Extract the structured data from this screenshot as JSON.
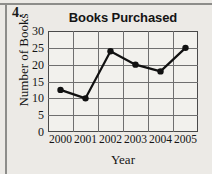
{
  "problem": {
    "number_label": "4."
  },
  "chart_data": {
    "type": "line",
    "title": "Books Purchased",
    "xlabel": "Year",
    "ylabel": "Number of Books",
    "categories": [
      "2000",
      "2001",
      "2002",
      "2003",
      "2004",
      "2005"
    ],
    "values": [
      12.5,
      10,
      24,
      20,
      18,
      25
    ],
    "ylim": [
      0,
      30
    ],
    "ytick_labels": [
      "0",
      "5",
      "10",
      "15",
      "20",
      "25",
      "30"
    ],
    "ytick_values": [
      0,
      5,
      10,
      15,
      20,
      25,
      30
    ],
    "grid": true,
    "legend": null,
    "marker": "filled-circle",
    "line_color": "#111111",
    "marker_color": "#111111",
    "grid_color": "#6f6f6f",
    "frame_color": "#4a4a4a",
    "background": "#f2f1ed"
  }
}
